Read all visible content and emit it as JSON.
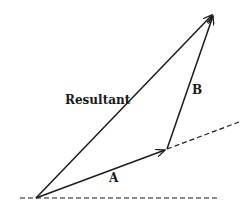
{
  "diagram": {
    "labels": {
      "resultant": "Resultant",
      "a": "A",
      "b": "B"
    },
    "colors": {
      "stroke": "#1a1a1a",
      "background": "#ffffff"
    },
    "points": {
      "origin": [
        36,
        198
      ],
      "a_tip": [
        167,
        149
      ],
      "b_tip": [
        214,
        13
      ]
    },
    "vectors": [
      {
        "name": "A",
        "from": "origin",
        "to": "a_tip"
      },
      {
        "name": "B",
        "from": "a_tip",
        "to": "b_tip"
      },
      {
        "name": "Resultant",
        "from": "origin",
        "to": "b_tip"
      }
    ],
    "reference_lines": [
      {
        "name": "horizontal-axis",
        "style": "dashed",
        "from": [
          20,
          198
        ],
        "to": [
          218,
          198
        ]
      },
      {
        "name": "extension-of-A",
        "style": "dashed",
        "from": [
          167,
          149
        ],
        "to": [
          239,
          122
        ]
      }
    ]
  }
}
